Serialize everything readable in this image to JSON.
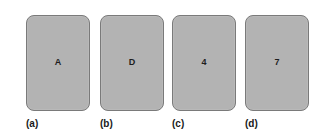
{
  "figure": {
    "cards": [
      {
        "face": "A",
        "caption": "(a)"
      },
      {
        "face": "D",
        "caption": "(b)"
      },
      {
        "face": "4",
        "caption": "(c)"
      },
      {
        "face": "7",
        "caption": "(d)"
      }
    ],
    "colors": {
      "card_fill": "#b3b3b3",
      "card_border": "#7a7a7a",
      "text": "#1e1e1e",
      "background": "#ffffff"
    }
  }
}
